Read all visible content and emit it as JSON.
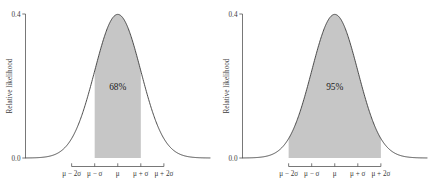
{
  "figure": {
    "panel_count": 2,
    "background_color": "#ffffff"
  },
  "chart_data": [
    {
      "type": "area",
      "title": "",
      "subtitle": "",
      "xlabel": "",
      "ylabel": "Relative likelihood",
      "curve": "standard normal density",
      "x": [
        -4,
        -3.75,
        -3.5,
        -3.25,
        -3,
        -2.75,
        -2.5,
        -2.25,
        -2,
        -1.75,
        -1.5,
        -1.25,
        -1,
        -0.75,
        -0.5,
        -0.25,
        0,
        0.25,
        0.5,
        0.75,
        1,
        1.25,
        1.5,
        1.75,
        2,
        2.25,
        2.5,
        2.75,
        3,
        3.25,
        3.5,
        3.75,
        4
      ],
      "values": [
        0.0001,
        0.0004,
        0.0009,
        0.002,
        0.0044,
        0.0091,
        0.0175,
        0.0317,
        0.054,
        0.0863,
        0.1295,
        0.1826,
        0.242,
        0.3011,
        0.3521,
        0.3867,
        0.3989,
        0.3867,
        0.3521,
        0.3011,
        0.242,
        0.1826,
        0.1295,
        0.0863,
        0.054,
        0.0317,
        0.0175,
        0.0091,
        0.0044,
        0.002,
        0.0009,
        0.0004,
        0.0001
      ],
      "xlim": [
        -4,
        4
      ],
      "ylim": [
        0.0,
        0.4
      ],
      "y_ticks": [
        "0.0",
        "0.4"
      ],
      "y_tick_values": [
        0.0,
        0.4
      ],
      "x_ticks": [
        "μ − 2σ",
        "μ − σ",
        "μ",
        "μ + σ",
        "μ + 2σ"
      ],
      "x_tick_values": [
        -2,
        -1,
        0,
        1,
        2
      ],
      "shaded_region": {
        "from": -1,
        "to": 1,
        "label": "68%",
        "label_x": 0,
        "label_y": 0.19,
        "fill_color": "#c6c6c6"
      },
      "grid": false,
      "legend": "none"
    },
    {
      "type": "area",
      "title": "",
      "subtitle": "",
      "xlabel": "",
      "ylabel": "Relative likelihood",
      "curve": "standard normal density",
      "x": [
        -4,
        -3.75,
        -3.5,
        -3.25,
        -3,
        -2.75,
        -2.5,
        -2.25,
        -2,
        -1.75,
        -1.5,
        -1.25,
        -1,
        -0.75,
        -0.5,
        -0.25,
        0,
        0.25,
        0.5,
        0.75,
        1,
        1.25,
        1.5,
        1.75,
        2,
        2.25,
        2.5,
        2.75,
        3,
        3.25,
        3.5,
        3.75,
        4
      ],
      "values": [
        0.0001,
        0.0004,
        0.0009,
        0.002,
        0.0044,
        0.0091,
        0.0175,
        0.0317,
        0.054,
        0.0863,
        0.1295,
        0.1826,
        0.242,
        0.3011,
        0.3521,
        0.3867,
        0.3989,
        0.3867,
        0.3521,
        0.3011,
        0.242,
        0.1826,
        0.1295,
        0.0863,
        0.054,
        0.0317,
        0.0175,
        0.0091,
        0.0044,
        0.002,
        0.0009,
        0.0004,
        0.0001
      ],
      "xlim": [
        -4,
        4
      ],
      "ylim": [
        0.0,
        0.4
      ],
      "y_ticks": [
        "0.0",
        "0.4"
      ],
      "y_tick_values": [
        0.0,
        0.4
      ],
      "x_ticks": [
        "μ − 2σ",
        "μ − σ",
        "μ",
        "μ + σ",
        "μ + 2σ"
      ],
      "x_tick_values": [
        -2,
        -1,
        0,
        1,
        2
      ],
      "shaded_region": {
        "from": -2,
        "to": 2,
        "label": "95%",
        "label_x": 0,
        "label_y": 0.19,
        "fill_color": "#c6c6c6"
      },
      "grid": false,
      "legend": "none"
    }
  ],
  "colors": {
    "curve_stroke": "#3a3a3a",
    "axis_stroke": "#555555",
    "shade_fill": "#c6c6c6",
    "text": "#3a3a3a",
    "background": "#ffffff"
  }
}
